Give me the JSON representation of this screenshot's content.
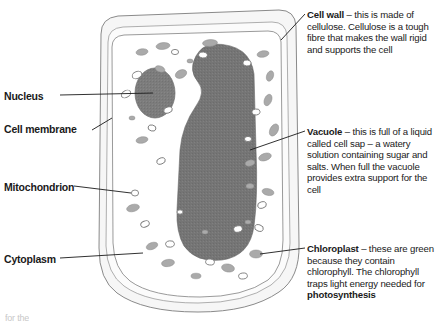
{
  "figure": {
    "kind": "plant-cell-diagram",
    "colors": {
      "outline": "#6e6e6e",
      "cell_wall_fill": "#f4f4f4",
      "cytoplasm_fill": "#ffffff",
      "vacuole_fill": "#757575",
      "nucleus_fill": "#7a7a7a",
      "chloroplast_fill": "#a8a8a8",
      "leader_line": "#1a1a1a",
      "text": "#1a1a1a"
    }
  },
  "labels": {
    "nucleus": "Nucleus",
    "cell_membrane": "Cell membrane",
    "mitochondrion": "Mitochondrion",
    "cytoplasm": "Cytoplasm"
  },
  "notes": {
    "cell_wall": {
      "term": "Cell wall",
      "body": " – this is made of cellulose. Cellulose is a tough fibre that makes the wall rigid and supports the cell"
    },
    "vacuole": {
      "term": "Vacuole",
      "body": " – this is full of a liquid called cell sap – a watery solution containing sugar and salts. When full the vacuole provides extra support for the cell"
    },
    "chloroplast": {
      "term": "Chloroplast",
      "body_before": " – these are green because they contain chlorophyll. The chlorophyll traps light energy needed for ",
      "emphasis": "photosynthesis"
    }
  },
  "bottom_crumb": "for the"
}
